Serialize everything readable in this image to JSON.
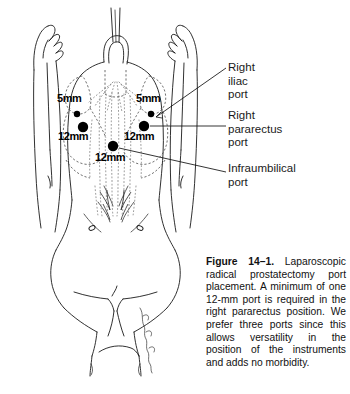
{
  "figure": {
    "number_label": "Figure 14–1.",
    "caption_body": " Laparoscopic radical prostatectomy port placement. A minimum of one 12-mm port is required in the right pararectus posi­tion. We prefer three ports since this allows versatility in the position of the instru­ments and adds no morbidity.",
    "artist_signature": "L. Mallory"
  },
  "illustration": {
    "subject": "supine-male-torso-anterior-view",
    "line_color": "#1a1a1a",
    "dashed_color": "#555555",
    "stipple_color": "#777777",
    "background": "#ffffff"
  },
  "ports": [
    {
      "id": "left-iliac",
      "size_label": "5mm",
      "diameter_px": 6,
      "cx": 77,
      "cy": 114,
      "label_x": 57,
      "label_y": 99
    },
    {
      "id": "left-pararectus",
      "size_label": "12mm",
      "diameter_px": 10,
      "cx": 83,
      "cy": 127,
      "label_x": 60,
      "label_y": 136
    },
    {
      "id": "right-iliac",
      "size_label": "5mm",
      "diameter_px": 6,
      "cx": 151,
      "cy": 114,
      "label_x": 137,
      "label_y": 99
    },
    {
      "id": "right-pararectus",
      "size_label": "12mm",
      "diameter_px": 10,
      "cx": 144,
      "cy": 126,
      "label_x": 127,
      "label_y": 136
    },
    {
      "id": "infraumbilical",
      "size_label": "12mm",
      "diameter_px": 10,
      "cx": 113,
      "cy": 146,
      "label_x": 97,
      "label_y": 157
    }
  ],
  "callouts": [
    {
      "id": "right-iliac-port",
      "text": "Right\niliac\nport",
      "x": 228,
      "y": 62,
      "leader": {
        "x1": 156,
        "y1": 117,
        "x2": 226,
        "y2": 68
      }
    },
    {
      "id": "right-pararectus-port",
      "text": "Right\npararectus\nport",
      "x": 228,
      "y": 110,
      "leader": {
        "x1": 150,
        "y1": 126,
        "x2": 226,
        "y2": 126
      }
    },
    {
      "id": "infraumbilical-port",
      "text": "Infraumbilical\nport",
      "x": 228,
      "y": 163,
      "leader": {
        "x1": 119,
        "y1": 148,
        "x2": 226,
        "y2": 172
      }
    }
  ]
}
